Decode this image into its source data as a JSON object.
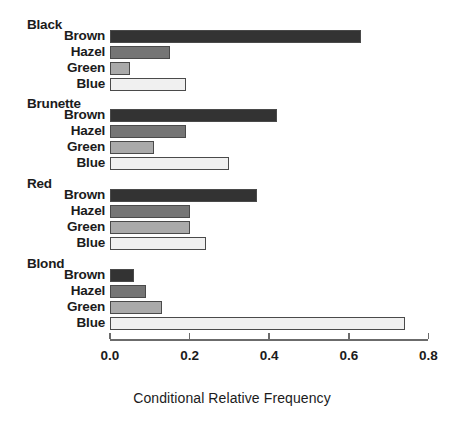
{
  "chart_data": {
    "type": "bar",
    "orientation": "horizontal",
    "title": "",
    "xlabel": "Conditional Relative Frequency",
    "ylabel": "",
    "xlim": [
      0.0,
      0.8
    ],
    "xticks": [
      "0.0",
      "0.2",
      "0.4",
      "0.6",
      "0.8"
    ],
    "xtick_values": [
      0.0,
      0.2,
      0.4,
      0.6,
      0.8
    ],
    "grid": false,
    "legend": "none",
    "categories": [
      "Brown",
      "Hazel",
      "Green",
      "Blue"
    ],
    "groups": [
      {
        "name": "Black",
        "bars": [
          {
            "label": "Brown",
            "value": 0.63,
            "color": "#333333"
          },
          {
            "label": "Hazel",
            "value": 0.15,
            "color": "#757575"
          },
          {
            "label": "Green",
            "value": 0.05,
            "color": "#aaaaaa"
          },
          {
            "label": "Blue",
            "value": 0.19,
            "color": "#f0f0f0"
          }
        ]
      },
      {
        "name": "Brunette",
        "bars": [
          {
            "label": "Brown",
            "value": 0.42,
            "color": "#333333"
          },
          {
            "label": "Hazel",
            "value": 0.19,
            "color": "#757575"
          },
          {
            "label": "Green",
            "value": 0.11,
            "color": "#aaaaaa"
          },
          {
            "label": "Blue",
            "value": 0.3,
            "color": "#f0f0f0"
          }
        ]
      },
      {
        "name": "Red",
        "bars": [
          {
            "label": "Brown",
            "value": 0.37,
            "color": "#333333"
          },
          {
            "label": "Hazel",
            "value": 0.2,
            "color": "#757575"
          },
          {
            "label": "Green",
            "value": 0.2,
            "color": "#aaaaaa"
          },
          {
            "label": "Blue",
            "value": 0.24,
            "color": "#f0f0f0"
          }
        ]
      },
      {
        "name": "Blond",
        "bars": [
          {
            "label": "Brown",
            "value": 0.06,
            "color": "#333333"
          },
          {
            "label": "Hazel",
            "value": 0.09,
            "color": "#757575"
          },
          {
            "label": "Green",
            "value": 0.13,
            "color": "#aaaaaa"
          },
          {
            "label": "Blue",
            "value": 0.74,
            "color": "#f0f0f0"
          }
        ]
      }
    ],
    "colors": {
      "brown_bar": "#333333",
      "hazel_bar": "#757575",
      "green_bar": "#aaaaaa",
      "blue_bar": "#f0f0f0",
      "bar_border": "#4a4a4a",
      "axis": "#6b6b6b",
      "text": "#1b1b1b",
      "background": "#ffffff"
    }
  },
  "layout": {
    "x_origin_px": 110,
    "x_scale_px_per_unit": 398,
    "axis_y_px": 339,
    "group_start_y_px": [
      17,
      96,
      176,
      256
    ],
    "bar_height_px": 13,
    "bar_pitch_px": 16,
    "header_to_first_bar_px": 13
  }
}
